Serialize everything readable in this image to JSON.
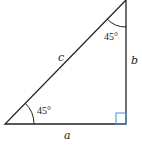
{
  "diagram": {
    "type": "right-triangle",
    "sides": {
      "hypotenuse": "c",
      "vertical": "b",
      "horizontal": "a"
    },
    "angles": {
      "bottom_left": "45°",
      "top": "45°"
    },
    "right_angle_marker_color": "#4a90d9",
    "line_color": "#222222"
  }
}
